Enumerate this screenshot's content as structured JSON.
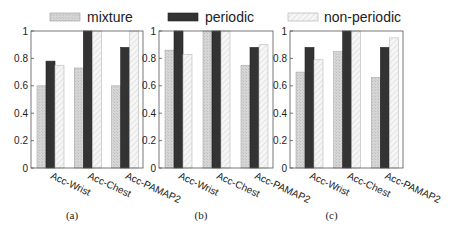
{
  "legend": {
    "items": [
      {
        "name": "mixture",
        "style": "mixture"
      },
      {
        "name": "periodic",
        "style": "periodic"
      },
      {
        "name": "non-periodic",
        "style": "nonperiodic"
      }
    ]
  },
  "colors": {
    "mixture_fill": "#d4d4d4",
    "periodic_fill": "#333333",
    "nonperiodic_fill": "#f4f4f4",
    "axis": "#444444"
  },
  "chart_data": [
    {
      "type": "bar",
      "caption": "(a)",
      "categories": [
        "Acc-Wrist",
        "Acc-Chest",
        "Acc-PAMAP2"
      ],
      "series": [
        {
          "name": "mixture",
          "values": [
            0.6,
            0.73,
            0.6
          ]
        },
        {
          "name": "periodic",
          "values": [
            0.78,
            1.0,
            0.88
          ]
        },
        {
          "name": "non-periodic",
          "values": [
            0.75,
            1.0,
            1.0
          ]
        }
      ],
      "yticks": [
        "0",
        "0.2",
        "0.4",
        "0.6",
        "0.8",
        "1"
      ],
      "ylim": [
        0,
        1
      ],
      "xlabel": "",
      "ylabel": "",
      "legend": "top"
    },
    {
      "type": "bar",
      "caption": "(b)",
      "categories": [
        "Acc-Wrist",
        "Acc-Chest",
        "Acc-PAMAP2"
      ],
      "series": [
        {
          "name": "mixture",
          "values": [
            0.86,
            1.0,
            0.75
          ]
        },
        {
          "name": "periodic",
          "values": [
            1.0,
            1.0,
            0.88
          ]
        },
        {
          "name": "non-periodic",
          "values": [
            0.83,
            1.0,
            0.9
          ]
        }
      ],
      "yticks": [
        "0",
        "0.2",
        "0.4",
        "0.6",
        "0.8",
        "1"
      ],
      "ylim": [
        0,
        1
      ],
      "xlabel": "",
      "ylabel": "",
      "legend": "top"
    },
    {
      "type": "bar",
      "caption": "(c)",
      "categories": [
        "Acc-Wrist",
        "Acc-Chest",
        "Acc-PAMAP2"
      ],
      "series": [
        {
          "name": "mixture",
          "values": [
            0.7,
            0.85,
            0.66
          ]
        },
        {
          "name": "periodic",
          "values": [
            0.88,
            1.0,
            0.88
          ]
        },
        {
          "name": "non-periodic",
          "values": [
            0.79,
            1.0,
            0.95
          ]
        }
      ],
      "yticks": [
        "0",
        "0.2",
        "0.4",
        "0.6",
        "0.8",
        "1"
      ],
      "ylim": [
        0,
        1
      ],
      "xlabel": "",
      "ylabel": "",
      "legend": "top"
    }
  ]
}
